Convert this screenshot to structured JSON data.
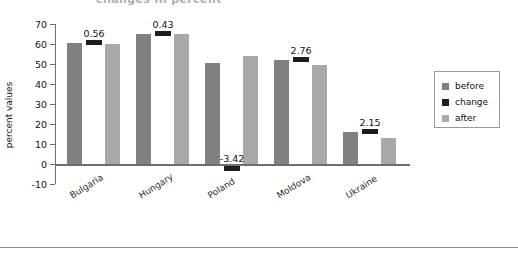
{
  "figure": {
    "clipped_top_title": "changes in percent",
    "bottom_rule": true
  },
  "chart_data": {
    "type": "bar",
    "title": "",
    "xlabel": "",
    "ylabel": "percent values",
    "ylim": [
      -10,
      70
    ],
    "ytick_step": 10,
    "yticks": [
      "70",
      "60",
      "50",
      "40",
      "30",
      "20",
      "10",
      "0",
      "-10"
    ],
    "grid": false,
    "legend_position": "right",
    "categories": [
      "Bulgaria",
      "Hungary",
      "Poland",
      "Moldova",
      "Ukraine"
    ],
    "series": [
      {
        "name": "before",
        "color": "#808080",
        "values": [
          60.5,
          65.0,
          50.5,
          52.0,
          16.0
        ]
      },
      {
        "name": "change",
        "color": "#1c1c1c",
        "values": [
          0.56,
          0.43,
          -3.42,
          2.76,
          2.15
        ]
      },
      {
        "name": "after",
        "color": "#a8a8a8",
        "values": [
          60.0,
          65.0,
          54.0,
          49.5,
          13.0
        ]
      }
    ],
    "change_labels": [
      "0.56",
      "0.43",
      "-3.42",
      "2.76",
      "2.15"
    ]
  },
  "legend": {
    "items": [
      {
        "label": "before",
        "color": "#808080"
      },
      {
        "label": "change",
        "color": "#1c1c1c"
      },
      {
        "label": "after",
        "color": "#a8a8a8"
      }
    ]
  },
  "colors": {
    "before": "#808080",
    "change": "#1c1c1c",
    "after": "#a8a8a8",
    "axis": "#6f6f6f",
    "text": "#111111"
  }
}
